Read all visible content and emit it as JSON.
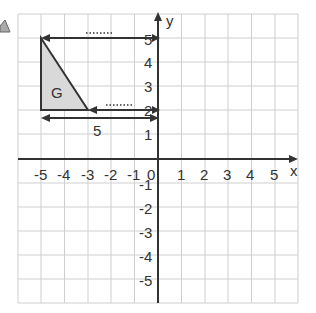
{
  "diagram": {
    "type": "coordinate-grid",
    "x_axis_label": "x",
    "y_axis_label": "y",
    "origin_label": "0",
    "x_ticks": [
      "-5",
      "-4",
      "-3",
      "-2",
      "-1",
      "1",
      "2",
      "3",
      "4",
      "5"
    ],
    "y_ticks": [
      "5",
      "4",
      "3",
      "2",
      "1",
      "-1",
      "-2",
      "-3",
      "-4",
      "-5"
    ],
    "shape": {
      "label": "G",
      "vertices": [
        [
          -5,
          5
        ],
        [
          -5,
          2
        ],
        [
          -3,
          2
        ]
      ],
      "fill": "#d9d9d9"
    },
    "arrows": [
      {
        "from": [
          0,
          5
        ],
        "to": [
          -5,
          5
        ],
        "label": "......."
      },
      {
        "from": [
          0,
          2
        ],
        "to": [
          -3,
          2
        ],
        "label": "......."
      },
      {
        "from": [
          -5,
          1.65
        ],
        "to": [
          0,
          1.65
        ],
        "label": "5",
        "double_headed": true
      }
    ],
    "colors": {
      "grid": "#cfcfcf",
      "axis": "#333333",
      "shape_fill": "#d9d9d9"
    }
  }
}
